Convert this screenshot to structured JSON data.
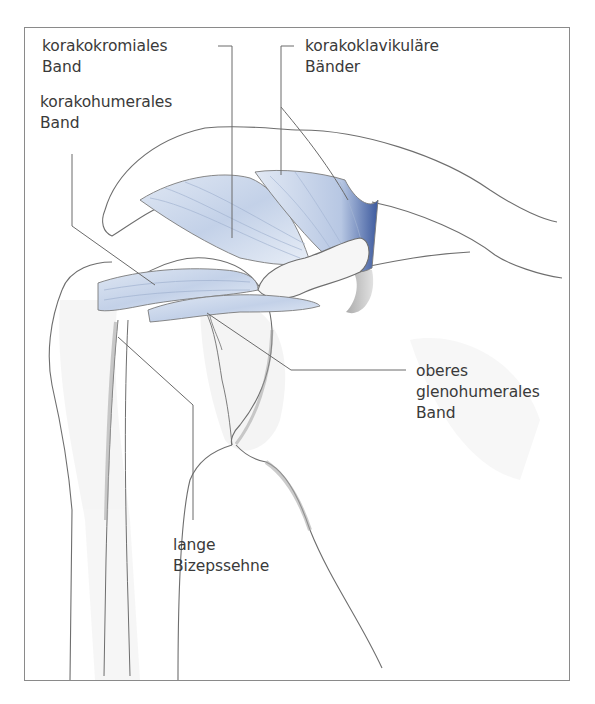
{
  "figure": {
    "type": "anatomical-illustration",
    "colors": {
      "ligament_blue": "#c9d6ea",
      "ligament_dark_blue": "#3d5a9e",
      "outline": "#6e6e6e",
      "bone_shadow": "#b9b9b9",
      "leader_line": "#6a6a6a",
      "frame": "#8a8a8a",
      "text": "#3a3a3a"
    }
  },
  "labels": {
    "korakoakromiales": {
      "line1": "korakokromiales",
      "line2": "Band"
    },
    "korakohumerales": {
      "line1": "korakohumerales",
      "line2": "Band"
    },
    "korakoklavikulaere": {
      "line1": "korakoklavikuläre",
      "line2": "Bänder"
    },
    "glenohumerales": {
      "line1": "oberes",
      "line2": "glenohumerales",
      "line3": "Band"
    },
    "bizeps": {
      "line1": "lange",
      "line2": "Bizepssehne"
    }
  }
}
